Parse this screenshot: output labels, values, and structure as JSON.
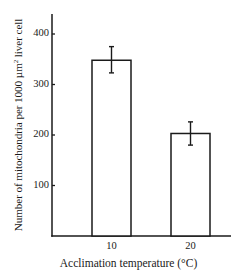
{
  "chart_data": {
    "type": "bar",
    "title": "",
    "xlabel": "Acclimation temperature (°C)",
    "ylabel": "Number of mitochondria per 1000 µm² liver cell",
    "ylabel_parts": {
      "pre": "Number of mitochondria per 1000 ",
      "unit": "µm",
      "sup": "2",
      "post": " liver cell"
    },
    "categories": [
      "10",
      "20"
    ],
    "values": [
      348,
      203
    ],
    "error_bars": [
      {
        "upper": 375,
        "lower": 323
      },
      {
        "upper": 226,
        "lower": 180
      }
    ],
    "yticks": [
      "100",
      "200",
      "300",
      "400"
    ],
    "ylim": [
      0,
      440
    ],
    "grid": false,
    "legend": null,
    "bar_fill": "#ffffff",
    "bar_edge": "#1a1a1a"
  }
}
